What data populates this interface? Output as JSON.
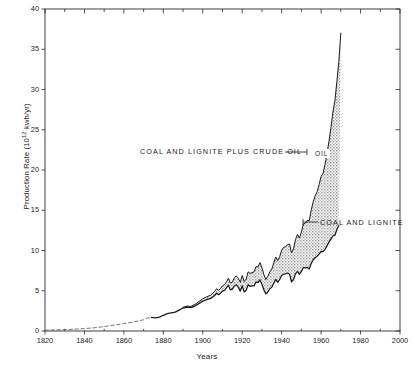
{
  "chart_data": {
    "type": "area",
    "title": "",
    "xlabel": "Years",
    "ylabel": "Production Rate (10¹² kwh/yr)",
    "ylabel_main": "Production Rate (10",
    "ylabel_exp": "12",
    "ylabel_tail": " kwh/yr)",
    "xlim": [
      1820,
      2000
    ],
    "ylim": [
      0,
      40
    ],
    "xticks": [
      1820,
      1840,
      1860,
      1880,
      1900,
      1920,
      1940,
      1960,
      1980,
      2000
    ],
    "xtick_labels": [
      "1820",
      "1840",
      "1860",
      "1880",
      "1900",
      "1920",
      "1940",
      "1960",
      "1980",
      "2000"
    ],
    "x_minor_step": 10,
    "yticks": [
      0,
      5,
      10,
      15,
      20,
      25,
      30,
      35,
      40
    ],
    "ytick_labels": [
      "0",
      "5",
      "10",
      "15",
      "20",
      "25",
      "30",
      "35",
      "40"
    ],
    "grid": false,
    "legend_position": "inline-annotations",
    "fill_color": "#c9c9c9",
    "line_color": "#1a1a1a",
    "annotations": [
      {
        "name": "total-curve-label",
        "text": "COAL AND LIGNITE PLUS CRUDE OIL",
        "x_px": 140,
        "y_px": 147,
        "leader_from_px": [
          285,
          152
        ],
        "leader_to_px": [
          307,
          152
        ]
      },
      {
        "name": "coal-curve-label",
        "text": "COAL AND LIGNITE",
        "x_px": 320,
        "y_px": 218,
        "leader_from_px": [
          318,
          222
        ],
        "leader_to_px": [
          303,
          222
        ]
      },
      {
        "name": "oil-band-label",
        "text": "OIL",
        "x_px": 313,
        "y_px": 149
      }
    ],
    "series": [
      {
        "name": "Coal and lignite",
        "style": "solid-with-early-dashed",
        "points": [
          [
            1820,
            0.1
          ],
          [
            1825,
            0.13
          ],
          [
            1830,
            0.17
          ],
          [
            1835,
            0.22
          ],
          [
            1840,
            0.3
          ],
          [
            1845,
            0.4
          ],
          [
            1850,
            0.55
          ],
          [
            1855,
            0.72
          ],
          [
            1860,
            0.92
          ],
          [
            1865,
            1.12
          ],
          [
            1870,
            1.4
          ],
          [
            1872,
            1.6
          ],
          [
            1874,
            1.7
          ],
          [
            1876,
            1.64
          ],
          [
            1878,
            1.72
          ],
          [
            1880,
            1.95
          ],
          [
            1882,
            2.15
          ],
          [
            1884,
            2.25
          ],
          [
            1886,
            2.35
          ],
          [
            1888,
            2.6
          ],
          [
            1890,
            2.85
          ],
          [
            1892,
            2.95
          ],
          [
            1894,
            2.9
          ],
          [
            1896,
            3.1
          ],
          [
            1898,
            3.4
          ],
          [
            1900,
            3.7
          ],
          [
            1902,
            3.9
          ],
          [
            1904,
            4.05
          ],
          [
            1906,
            4.4
          ],
          [
            1907,
            4.7
          ],
          [
            1908,
            4.5
          ],
          [
            1909,
            4.7
          ],
          [
            1910,
            4.95
          ],
          [
            1911,
            5.05
          ],
          [
            1912,
            5.35
          ],
          [
            1913,
            5.7
          ],
          [
            1914,
            5.1
          ],
          [
            1915,
            5.2
          ],
          [
            1916,
            5.6
          ],
          [
            1917,
            5.75
          ],
          [
            1918,
            5.45
          ],
          [
            1919,
            4.95
          ],
          [
            1920,
            5.6
          ],
          [
            1921,
            4.85
          ],
          [
            1922,
            5.05
          ],
          [
            1923,
            5.75
          ],
          [
            1924,
            5.55
          ],
          [
            1925,
            5.6
          ],
          [
            1926,
            5.6
          ],
          [
            1927,
            6.1
          ],
          [
            1928,
            6.0
          ],
          [
            1929,
            6.35
          ],
          [
            1930,
            5.8
          ],
          [
            1931,
            5.1
          ],
          [
            1932,
            4.6
          ],
          [
            1933,
            4.85
          ],
          [
            1934,
            5.25
          ],
          [
            1935,
            5.45
          ],
          [
            1936,
            5.95
          ],
          [
            1937,
            6.4
          ],
          [
            1938,
            6.05
          ],
          [
            1939,
            6.4
          ],
          [
            1940,
            6.9
          ],
          [
            1941,
            7.05
          ],
          [
            1942,
            7.1
          ],
          [
            1943,
            7.2
          ],
          [
            1944,
            7.05
          ],
          [
            1945,
            6.1
          ],
          [
            1946,
            6.4
          ],
          [
            1947,
            7.1
          ],
          [
            1948,
            7.4
          ],
          [
            1949,
            7.05
          ],
          [
            1950,
            7.4
          ],
          [
            1951,
            7.9
          ],
          [
            1952,
            7.85
          ],
          [
            1953,
            7.9
          ],
          [
            1954,
            7.7
          ],
          [
            1955,
            8.4
          ],
          [
            1956,
            8.85
          ],
          [
            1957,
            9.1
          ],
          [
            1958,
            9.3
          ],
          [
            1959,
            9.55
          ],
          [
            1960,
            9.9
          ],
          [
            1961,
            9.85
          ],
          [
            1962,
            10.15
          ],
          [
            1963,
            10.6
          ],
          [
            1964,
            11.05
          ],
          [
            1965,
            11.45
          ],
          [
            1966,
            11.8
          ],
          [
            1967,
            11.9
          ],
          [
            1968,
            12.6
          ],
          [
            1969,
            13.1
          ]
        ]
      },
      {
        "name": "Coal and lignite plus crude oil",
        "style": "solid",
        "points": [
          [
            1890,
            2.95
          ],
          [
            1892,
            3.1
          ],
          [
            1894,
            3.05
          ],
          [
            1896,
            3.3
          ],
          [
            1898,
            3.65
          ],
          [
            1900,
            4.0
          ],
          [
            1902,
            4.25
          ],
          [
            1904,
            4.45
          ],
          [
            1906,
            4.9
          ],
          [
            1907,
            5.25
          ],
          [
            1908,
            5.05
          ],
          [
            1909,
            5.3
          ],
          [
            1910,
            5.6
          ],
          [
            1911,
            5.75
          ],
          [
            1912,
            6.1
          ],
          [
            1913,
            6.55
          ],
          [
            1914,
            5.95
          ],
          [
            1915,
            6.1
          ],
          [
            1916,
            6.6
          ],
          [
            1917,
            6.85
          ],
          [
            1918,
            6.55
          ],
          [
            1919,
            6.05
          ],
          [
            1920,
            6.9
          ],
          [
            1921,
            6.15
          ],
          [
            1922,
            6.45
          ],
          [
            1923,
            7.35
          ],
          [
            1924,
            7.15
          ],
          [
            1925,
            7.25
          ],
          [
            1926,
            7.35
          ],
          [
            1927,
            8.0
          ],
          [
            1928,
            7.95
          ],
          [
            1929,
            8.5
          ],
          [
            1930,
            7.85
          ],
          [
            1931,
            7.0
          ],
          [
            1932,
            6.4
          ],
          [
            1933,
            6.8
          ],
          [
            1934,
            7.35
          ],
          [
            1935,
            7.7
          ],
          [
            1936,
            8.45
          ],
          [
            1937,
            9.2
          ],
          [
            1938,
            8.75
          ],
          [
            1939,
            9.25
          ],
          [
            1940,
            10.05
          ],
          [
            1941,
            10.4
          ],
          [
            1942,
            10.45
          ],
          [
            1943,
            10.75
          ],
          [
            1944,
            10.8
          ],
          [
            1945,
            9.7
          ],
          [
            1946,
            10.2
          ],
          [
            1947,
            11.35
          ],
          [
            1948,
            12.0
          ],
          [
            1949,
            11.55
          ],
          [
            1950,
            12.3
          ],
          [
            1951,
            13.3
          ],
          [
            1952,
            13.4
          ],
          [
            1953,
            13.75
          ],
          [
            1954,
            13.7
          ],
          [
            1955,
            15.05
          ],
          [
            1956,
            16.05
          ],
          [
            1957,
            16.8
          ],
          [
            1958,
            17.3
          ],
          [
            1959,
            18.2
          ],
          [
            1960,
            19.2
          ],
          [
            1961,
            19.6
          ],
          [
            1962,
            20.7
          ],
          [
            1963,
            22.0
          ],
          [
            1964,
            23.6
          ],
          [
            1965,
            25.3
          ],
          [
            1966,
            27.2
          ],
          [
            1967,
            28.6
          ],
          [
            1968,
            31.0
          ],
          [
            1969,
            33.5
          ],
          [
            1970,
            37.0
          ]
        ]
      }
    ]
  }
}
